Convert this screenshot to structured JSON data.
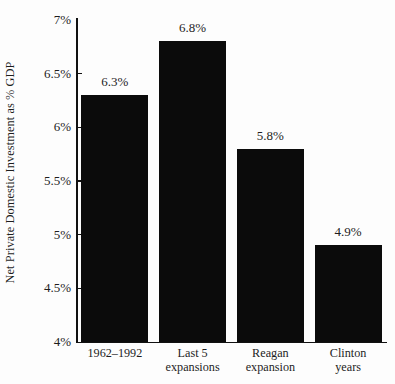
{
  "chart_data": {
    "type": "bar",
    "title": "",
    "xlabel": "",
    "ylabel": "Net Private Domestic Investment as % GDP",
    "ylim": [
      4,
      7
    ],
    "ytick_values": [
      7,
      6.5,
      6,
      5.5,
      5,
      4.5,
      4
    ],
    "ytick_labels": [
      "7%",
      "6.5%",
      "6%",
      "5.5%",
      "5%",
      "4.5%",
      "4%"
    ],
    "grid": false,
    "legend": "none",
    "bar_color": "#0b0b0b",
    "background_color": "#fdfdfd",
    "categories": [
      "1962–1992",
      "Last 5 expansions",
      "Reagan expansion",
      "Clinton years"
    ],
    "category_lines": [
      [
        "1962–1992"
      ],
      [
        "Last 5",
        "expansions"
      ],
      [
        "Reagan",
        "expansion"
      ],
      [
        "Clinton",
        "years"
      ]
    ],
    "values": [
      6.3,
      6.8,
      5.8,
      4.9
    ],
    "value_labels": [
      "6.3%",
      "6.8%",
      "5.8%",
      "4.9%"
    ]
  }
}
